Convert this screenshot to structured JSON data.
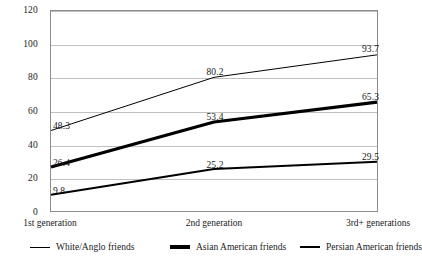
{
  "chart_data": {
    "type": "line",
    "title": "",
    "subtitle": "",
    "xlabel": "",
    "ylabel": "",
    "categories": [
      "1st generation",
      "2nd generation",
      "3rd+ generations"
    ],
    "ylim": [
      0,
      120
    ],
    "yticks": [
      0,
      20,
      40,
      60,
      80,
      100,
      120
    ],
    "ytick_labels": [
      "0",
      "20",
      "40",
      "60",
      "80",
      "100",
      "120"
    ],
    "grid": true,
    "legend_position": "bottom",
    "series": [
      {
        "name": "White/Anglo friends",
        "values": [
          48.3,
          80.2,
          93.7
        ],
        "labels": [
          "48.3",
          "80.2",
          "93.7"
        ],
        "color": "#000000",
        "line_width": 1
      },
      {
        "name": "Asian American friends",
        "values": [
          26.4,
          53.4,
          65.3
        ],
        "labels": [
          "26.4",
          "53.4",
          "65.3"
        ],
        "color": "#000000",
        "line_width": 3.2
      },
      {
        "name": "Persian American friends",
        "values": [
          9.8,
          25.2,
          29.5
        ],
        "labels": [
          "9.8",
          "25.2",
          "29.5"
        ],
        "color": "#000000",
        "line_width": 2
      }
    ]
  }
}
